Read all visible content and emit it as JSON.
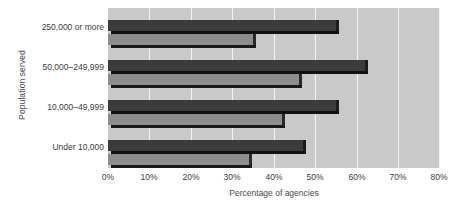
{
  "chart_data": {
    "type": "bar",
    "orientation": "horizontal",
    "title": "",
    "xlabel": "Percentage of agencies",
    "ylabel": "Population served",
    "categories": [
      "250,000 or more",
      "50,000–249,999",
      "10,000–49,999",
      "Under 10,000"
    ],
    "series": [
      {
        "name": "2003",
        "color": "#3b3b3b",
        "values": [
          55,
          62,
          55,
          47
        ]
      },
      {
        "name": "2000",
        "color": "#8d8d8d",
        "values": [
          35,
          46,
          42,
          34
        ]
      }
    ],
    "xlim": [
      0,
      80
    ],
    "xticks": [
      0,
      10,
      20,
      30,
      40,
      50,
      60,
      70,
      80
    ],
    "xtick_labels": [
      "0%",
      "10%",
      "20%",
      "30%",
      "40%",
      "50%",
      "60%",
      "70%",
      "80%"
    ],
    "grid": "vertical",
    "legend_position": "right-inside",
    "plot_background": "#c9c9c9",
    "gridline_color": "#f2f2f2"
  }
}
